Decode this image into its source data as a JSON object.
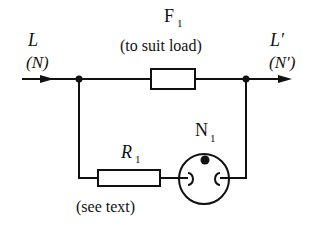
{
  "diagram": {
    "type": "circuit",
    "input_label": "L",
    "input_label_alt": "(N)",
    "output_label": "L′",
    "output_label_alt": "(N′)",
    "fuse": {
      "name": "F",
      "subscript": "1",
      "note": "(to suit load)"
    },
    "resistor": {
      "name": "R",
      "subscript": "1",
      "note": "(see text)"
    },
    "neon": {
      "name": "N",
      "subscript": "1"
    },
    "colors": {
      "line": "#111111",
      "background": "#ffffff"
    }
  }
}
